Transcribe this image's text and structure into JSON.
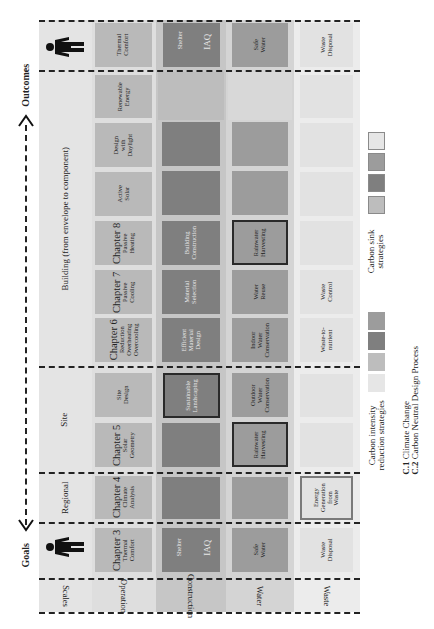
{
  "orientation": "rotated-90-ccw",
  "axis": {
    "goals_label": "Goals",
    "outcomes_label": "Outcomes"
  },
  "row_labels": {
    "scales": "Scales",
    "operation": "Operation",
    "construction": "Construction",
    "water": "Water",
    "waste": "Waste"
  },
  "scales": {
    "regional": "Regional",
    "site": "Site",
    "building": "Building (from envelope to component)"
  },
  "goals_column": {
    "operation": {
      "chapter": "Chapter 3",
      "text": "Thermal\nComfort"
    },
    "construction": {
      "left": "Shelter",
      "right": "IAQ"
    },
    "water": "Safe\nWater",
    "waste": "Waste\nDisposal"
  },
  "regional_column": {
    "operation": {
      "chapter": "Chapter 4",
      "text": "Climate\nAnalysis"
    },
    "construction": "",
    "water": "",
    "waste": "Energy\nGeneration\nfrom\nWaste"
  },
  "site_columns": [
    {
      "operation": {
        "chapter": "Chapter 5",
        "text": "Solar\nGeometry"
      },
      "construction": "",
      "water": "Rainwater\nHarvesting",
      "waste": ""
    },
    {
      "operation": {
        "chapter": "",
        "text": "Site\nDesign"
      },
      "construction": "Sustainable\nLandscaping",
      "water": "Outdoor\nWater\nConservation",
      "waste": ""
    }
  ],
  "building_columns": [
    {
      "operation": {
        "chapter": "Chapter 6",
        "text": "Reduction\nOverheating\nOvercooling"
      },
      "construction": "Efficient\nMaterial\nDesign",
      "water": "Indoor\nWater\nConservation",
      "waste": "Waste-to-\nnutrient"
    },
    {
      "operation": {
        "chapter": "Chapter 7",
        "text": "Passive\nCooling"
      },
      "construction": "Material\nSelection",
      "water": "Water\nReuse",
      "waste": "Waste\nControl"
    },
    {
      "operation": {
        "chapter": "Chapter 8",
        "text": "Passive\nHeating"
      },
      "construction": "Building\nConstruction",
      "water": "Rainwater\nHarvesting",
      "waste": ""
    },
    {
      "operation": {
        "chapter": "",
        "text": "Active\nSolar"
      },
      "construction": "",
      "water": "",
      "waste": ""
    },
    {
      "operation": {
        "chapter": "",
        "text": "Design\nwith\nDaylight"
      },
      "construction": "",
      "water": "",
      "waste": ""
    },
    {
      "operation": {
        "chapter": "",
        "text": "Renewable\nEnergy"
      },
      "construction": "",
      "water": "",
      "waste": ""
    }
  ],
  "outcomes_column": {
    "operation": "Thermal\nComfort",
    "construction": {
      "left": "Shelter",
      "right": "IAQ"
    },
    "water": "Safe\nWater",
    "waste": "Waste\nDisposal"
  },
  "legend": {
    "carbon_intensity": "Carbon intensity\nreduction strategies",
    "carbon_sink": "Carbon sink\nstrategies",
    "c1": "C.1 Climate Change",
    "c2": "C.2 Carbon Neutral Design Process",
    "c1_prefix": "C.1",
    "c1_text": "Climate Change",
    "c2_prefix": "C.2",
    "c2_text": "Carbon Neutral Design Process"
  },
  "colors": {
    "operation": "#b9b9b9",
    "construction": "#7f7f7f",
    "water": "#9c9c9c",
    "waste": "#e2e2e2",
    "band_scales": "#e4e4e4",
    "band_operation": "#dedede",
    "band_construction": "#c6c6c6",
    "band_water": "#d4d4d4",
    "band_waste": "#ececec"
  }
}
